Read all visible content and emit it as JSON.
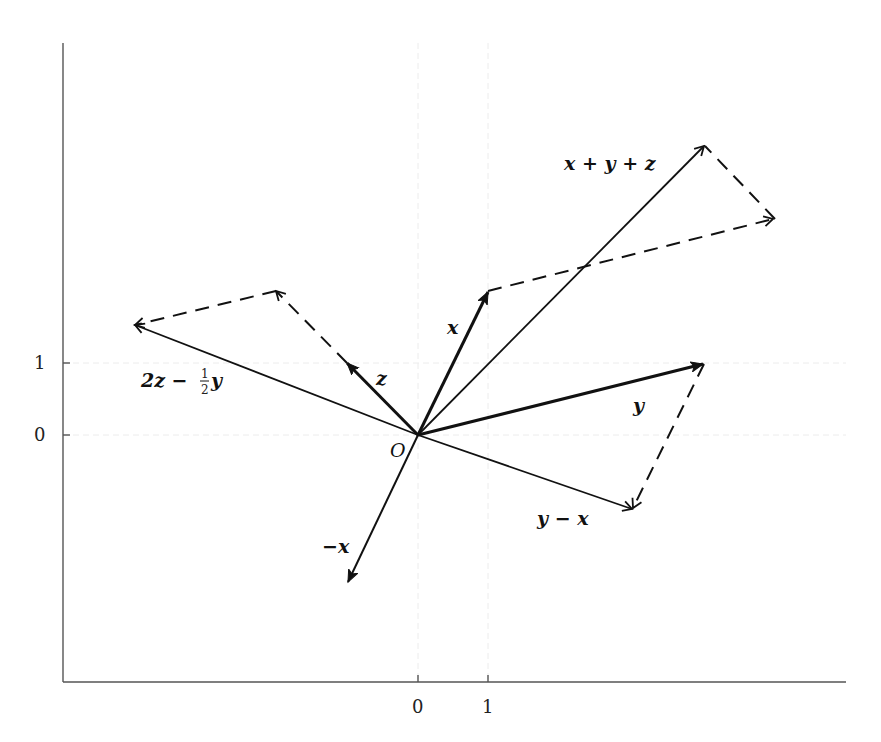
{
  "figure": {
    "origin_label": "O",
    "x_ticks": [
      {
        "value": 0,
        "label": "0"
      },
      {
        "value": 1,
        "label": "1"
      }
    ],
    "y_ticks": [
      {
        "value": 0,
        "label": "0"
      },
      {
        "value": 1,
        "label": "1"
      }
    ],
    "colors": {
      "line": "#111111",
      "axis": "#555555",
      "grid": "#e6e6e6"
    }
  },
  "vectors": [
    {
      "name": "x",
      "label": "x",
      "x": 1,
      "y": 2
    },
    {
      "name": "y",
      "label": "y",
      "x": 4,
      "y": 1
    },
    {
      "name": "z",
      "label": "z",
      "x": -1,
      "y": 1
    },
    {
      "name": "neg-x",
      "label": "−x",
      "x": -1,
      "y": -2
    },
    {
      "name": "x-plus-y-plus-z",
      "label": "x + y + z",
      "x": 4,
      "y": 4
    },
    {
      "name": "y-minus-x",
      "label": "y − x",
      "x": 3,
      "y": -1
    },
    {
      "name": "two-z-minus-half-y",
      "label": "2z − ½y",
      "x": -4,
      "y": 1.5
    }
  ],
  "labels": {
    "x": "x",
    "y": "y",
    "z": "z",
    "neg_x": "−x",
    "sum": "x + y + z",
    "diff": "y − x",
    "combo_a": "2z − ",
    "combo_frac_num": "1",
    "combo_frac_den": "2",
    "combo_b": "y"
  }
}
